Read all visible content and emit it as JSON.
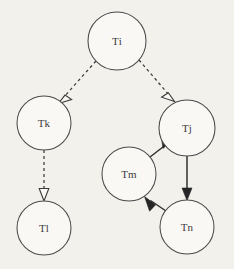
{
  "diagram": {
    "background_color": "#f3f1ec",
    "node_fill_color": "#faf8f4",
    "node_stroke_color": "#4a4a4a",
    "solid_edge_color": "#303030",
    "dashed_edge_color": "#3c3c3c",
    "label_color": "#3a3a3a",
    "nodes": [
      {
        "id": "ti",
        "label": "Ti",
        "cx": 117,
        "cy": 41,
        "r": 29
      },
      {
        "id": "tk",
        "label": "Tk",
        "cx": 44,
        "cy": 123,
        "r": 27
      },
      {
        "id": "tj",
        "label": "Tj",
        "cx": 187,
        "cy": 128,
        "r": 28
      },
      {
        "id": "tm",
        "label": "Tm",
        "cx": 129,
        "cy": 174,
        "r": 27
      },
      {
        "id": "tl",
        "label": "Tl",
        "cx": 44,
        "cy": 228,
        "r": 27
      },
      {
        "id": "tn",
        "label": "Tn",
        "cx": 187,
        "cy": 227,
        "r": 27
      }
    ],
    "edges": [
      {
        "id": "ti-tk",
        "from": "Ti",
        "to": "Tk",
        "style": "dashed",
        "arrowhead": "open"
      },
      {
        "id": "ti-tj",
        "from": "Ti",
        "to": "Tj",
        "style": "dashed",
        "arrowhead": "open"
      },
      {
        "id": "tk-tl",
        "from": "Tk",
        "to": "Tl",
        "style": "dashed",
        "arrowhead": "open"
      },
      {
        "id": "tm-tj",
        "from": "Tm",
        "to": "Tj",
        "style": "solid",
        "arrowhead": "filled"
      },
      {
        "id": "tj-tn",
        "from": "Tj",
        "to": "Tn",
        "style": "solid",
        "arrowhead": "filled"
      },
      {
        "id": "tn-tm",
        "from": "Tn",
        "to": "Tm",
        "style": "solid",
        "arrowhead": "filled"
      }
    ]
  }
}
